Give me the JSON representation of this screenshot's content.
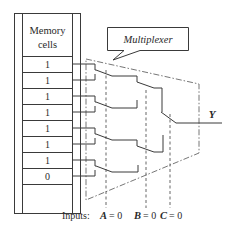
{
  "diagram": {
    "memory": {
      "header_line1": "Memory",
      "header_line2": "cells",
      "cells": [
        "1",
        "1",
        "1",
        "1",
        "1",
        "1",
        "1",
        "0"
      ]
    },
    "callout": {
      "label": "Multiplexer"
    },
    "output": {
      "label": "Y"
    },
    "inputs": {
      "prefix": "Inputs:",
      "A": {
        "name": "A",
        "value": "= 0"
      },
      "B": {
        "name": "B",
        "value": "= 0"
      },
      "C": {
        "name": "C",
        "value": "= 0"
      }
    },
    "colors": {
      "line": "#3a3a3a",
      "text": "#2a2a2a",
      "background": "#ffffff"
    }
  }
}
